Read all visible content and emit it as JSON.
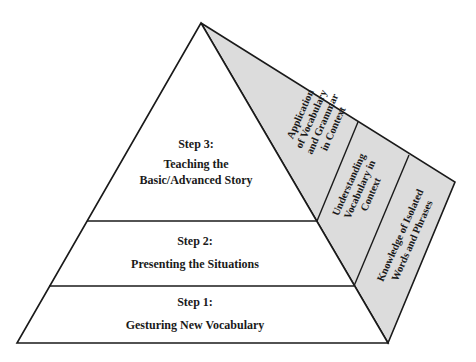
{
  "diagram": {
    "type": "pyramid",
    "colors": {
      "front_face": "#ffffff",
      "side_face": "#dcdcdc",
      "stroke": "#1a1a1a",
      "text": "#1a1a1a"
    },
    "steps": [
      {
        "title": "Step 3:",
        "lines": [
          "Teaching the",
          "Basic/Advanced Story"
        ]
      },
      {
        "title": "Step 2:",
        "lines": [
          "Presenting the Situations"
        ]
      },
      {
        "title": "Step 1:",
        "lines": [
          "Gesturing New Vocabulary"
        ]
      }
    ],
    "side_labels": [
      {
        "lines": [
          "Application",
          "of Vocabulary",
          "and Grammar",
          "in Context"
        ]
      },
      {
        "lines": [
          "Understanding",
          "Vocabulary in",
          "Context"
        ]
      },
      {
        "lines": [
          "Knowledge of Isolated",
          "Words and Phrases"
        ]
      }
    ]
  }
}
